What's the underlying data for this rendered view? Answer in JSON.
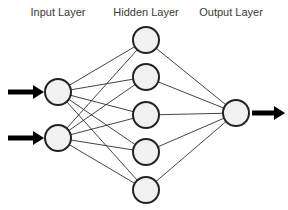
{
  "diagram": {
    "background_color": "#ffffff",
    "labels": {
      "input": "Input Layer",
      "hidden": "Hidden Layer",
      "output": "Output Layer"
    },
    "style": {
      "node_fill": "#f1f1f1",
      "node_stroke": "#232323",
      "node_stroke_width": 2,
      "node_radius": 13,
      "edge_color": "#2f2f2f",
      "edge_width": 0.9,
      "arrow_color": "#000000",
      "label_color": "#3a3a3a",
      "label_font_size": 11
    },
    "label_positions": {
      "input": {
        "x": 58,
        "y": 16
      },
      "hidden": {
        "x": 146,
        "y": 16
      },
      "output": {
        "x": 231,
        "y": 16
      }
    },
    "layers": [
      {
        "name": "input",
        "label": "Input Layer",
        "node_count": 2,
        "nodes": [
          {
            "id": "i1",
            "cx": 58,
            "cy": 92,
            "r": 13
          },
          {
            "id": "i2",
            "cx": 58,
            "cy": 138,
            "r": 13
          }
        ]
      },
      {
        "name": "hidden",
        "label": "Hidden Layer",
        "node_count": 5,
        "nodes": [
          {
            "id": "h1",
            "cx": 146,
            "cy": 40,
            "r": 13
          },
          {
            "id": "h2",
            "cx": 146,
            "cy": 77,
            "r": 13
          },
          {
            "id": "h3",
            "cx": 146,
            "cy": 115,
            "r": 13
          },
          {
            "id": "h4",
            "cx": 146,
            "cy": 152,
            "r": 13
          },
          {
            "id": "h5",
            "cx": 146,
            "cy": 190,
            "r": 13
          }
        ]
      },
      {
        "name": "output",
        "label": "Output Layer",
        "node_count": 1,
        "nodes": [
          {
            "id": "o1",
            "cx": 236,
            "cy": 113,
            "r": 13
          }
        ]
      }
    ],
    "connections": {
      "input_to_hidden": "fully-connected",
      "hidden_to_output": "fully-connected",
      "edges": [
        {
          "from": "i1",
          "to": "h1"
        },
        {
          "from": "i1",
          "to": "h2"
        },
        {
          "from": "i1",
          "to": "h3"
        },
        {
          "from": "i1",
          "to": "h4"
        },
        {
          "from": "i1",
          "to": "h5"
        },
        {
          "from": "i2",
          "to": "h1"
        },
        {
          "from": "i2",
          "to": "h2"
        },
        {
          "from": "i2",
          "to": "h3"
        },
        {
          "from": "i2",
          "to": "h4"
        },
        {
          "from": "i2",
          "to": "h5"
        },
        {
          "from": "h1",
          "to": "o1"
        },
        {
          "from": "h2",
          "to": "o1"
        },
        {
          "from": "h3",
          "to": "o1"
        },
        {
          "from": "h4",
          "to": "o1"
        },
        {
          "from": "h5",
          "to": "o1"
        }
      ]
    },
    "io_arrows": [
      {
        "id": "input-arrow-1",
        "direction": "right",
        "x1": 8,
        "x2": 44,
        "y": 92
      },
      {
        "id": "input-arrow-2",
        "direction": "right",
        "x1": 8,
        "x2": 44,
        "y": 138
      },
      {
        "id": "output-arrow-1",
        "direction": "right",
        "x1": 252,
        "x2": 285,
        "y": 113
      }
    ]
  }
}
